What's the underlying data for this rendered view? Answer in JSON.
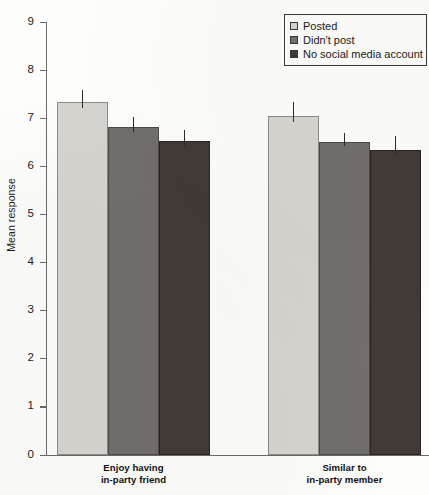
{
  "chart_data": {
    "type": "bar",
    "title": "",
    "xlabel": "",
    "ylabel": "Mean response",
    "ylim": [
      0,
      9
    ],
    "yticks": [
      "0",
      "1",
      "2",
      "3",
      "4",
      "5",
      "6",
      "7",
      "8",
      "9"
    ],
    "grid": false,
    "legend_position": "top-right",
    "categories": [
      "Enjoy having in-party friend",
      "Similar to in-party member"
    ],
    "category_lines": [
      [
        "Enjoy having",
        "in-party friend"
      ],
      [
        "Similar to",
        "in-party member"
      ]
    ],
    "series": [
      {
        "name": "Posted",
        "color": "#d6d4ce",
        "values": [
          7.33,
          7.05
        ],
        "errors": [
          0.26,
          0.28
        ]
      },
      {
        "name": "Didn't post",
        "color": "#706f6b",
        "values": [
          6.81,
          6.5
        ],
        "errors": [
          0.21,
          0.19
        ]
      },
      {
        "name": "No social media account",
        "color": "#423a37",
        "values": [
          6.53,
          6.34
        ],
        "errors": [
          0.22,
          0.3
        ]
      }
    ]
  },
  "legend": {
    "items": [
      {
        "label": "Posted",
        "swatch": "light-gray"
      },
      {
        "label": "Didn't post",
        "swatch": "medium-gray"
      },
      {
        "label": "No social media account",
        "swatch": "dark-gray"
      }
    ]
  },
  "axis": {
    "y_label": "Mean response"
  }
}
